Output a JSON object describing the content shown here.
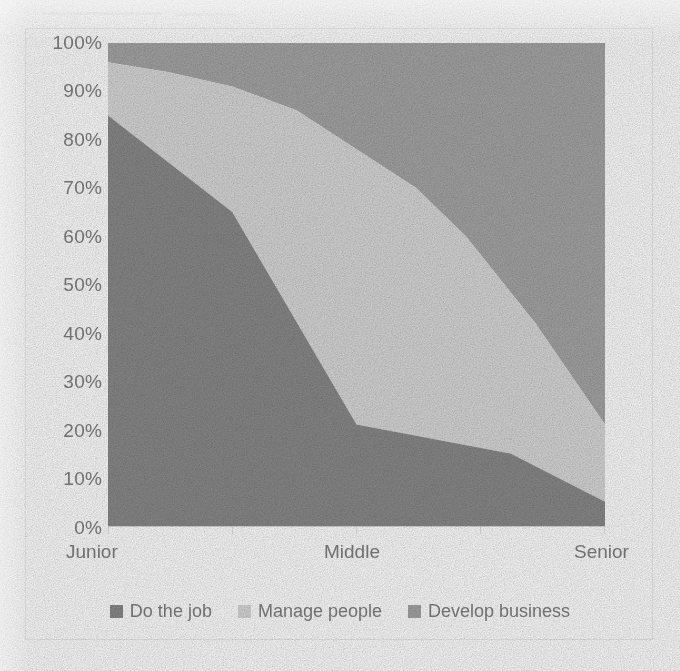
{
  "chart_data": {
    "type": "area",
    "stacked": true,
    "normalized": true,
    "title": "",
    "subtitle": "",
    "xlabel": "",
    "ylabel": "",
    "categories": [
      "Junior",
      "Middle",
      "Senior"
    ],
    "x_tick_labels": [
      "Junior",
      "Middle",
      "Senior"
    ],
    "y_tick_labels": [
      "0%",
      "10%",
      "20%",
      "30%",
      "40%",
      "50%",
      "60%",
      "70%",
      "80%",
      "90%",
      "100%"
    ],
    "y_ticks": [
      0,
      10,
      20,
      30,
      40,
      50,
      60,
      70,
      80,
      90,
      100
    ],
    "ylim": [
      0,
      100
    ],
    "xlim": [
      0,
      100
    ],
    "grid": false,
    "legend_position": "bottom",
    "series": [
      {
        "name": "Do the job",
        "color": "#8a8a8a",
        "values": [
          85,
          21,
          5
        ],
        "x_fraction": [
          0,
          0.5,
          1
        ],
        "detailed_points": [
          {
            "x": 0.0,
            "y": 85
          },
          {
            "x": 0.25,
            "y": 65
          },
          {
            "x": 0.5,
            "y": 21
          },
          {
            "x": 0.81,
            "y": 15
          },
          {
            "x": 1.0,
            "y": 5
          }
        ]
      },
      {
        "name": "Manage people",
        "color": "#d9d9d9",
        "values": [
          11,
          57,
          16
        ],
        "x_fraction": [
          0,
          0.5,
          1
        ],
        "cumulative_top_points": [
          {
            "x": 0.0,
            "y": 96
          },
          {
            "x": 0.12,
            "y": 94
          },
          {
            "x": 0.25,
            "y": 91
          },
          {
            "x": 0.38,
            "y": 86
          },
          {
            "x": 0.5,
            "y": 78
          },
          {
            "x": 0.62,
            "y": 70
          },
          {
            "x": 0.72,
            "y": 60
          },
          {
            "x": 0.86,
            "y": 42
          },
          {
            "x": 1.0,
            "y": 21
          }
        ]
      },
      {
        "name": "Develop business",
        "color": "#a6a6a6",
        "values": [
          4,
          22,
          79
        ],
        "x_fraction": [
          0,
          0.5,
          1
        ]
      }
    ],
    "legend": [
      {
        "label": "Do the job",
        "color": "#8a8a8a"
      },
      {
        "label": "Manage people",
        "color": "#d9d9d9"
      },
      {
        "label": "Develop business",
        "color": "#a6a6a6"
      }
    ]
  },
  "colors": {
    "do_the_job": "#8a8a8a",
    "manage_people": "#d9d9d9",
    "develop_business": "#a6a6a6",
    "axis_text": "#808080",
    "page_background": "#ffffff",
    "border": "#ececec"
  }
}
